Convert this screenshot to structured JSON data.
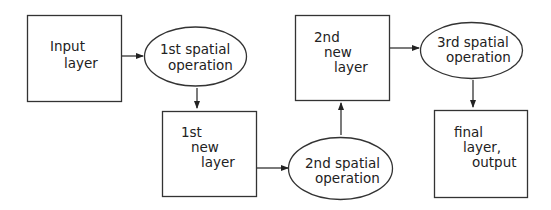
{
  "diagram": {
    "type": "flowchart",
    "nodes": [
      {
        "id": "input_layer",
        "shape": "rect",
        "lines": [
          "Input",
          "layer"
        ]
      },
      {
        "id": "op1",
        "shape": "ellipse",
        "lines": [
          "1st spatial",
          "operation"
        ]
      },
      {
        "id": "new_layer_1",
        "shape": "rect",
        "lines": [
          "1st",
          "new",
          "layer"
        ]
      },
      {
        "id": "op2",
        "shape": "ellipse",
        "lines": [
          "2nd spatial",
          "operation"
        ]
      },
      {
        "id": "new_layer_2",
        "shape": "rect",
        "lines": [
          "2nd",
          "new",
          "layer"
        ]
      },
      {
        "id": "op3",
        "shape": "ellipse",
        "lines": [
          "3rd spatial",
          "operation"
        ]
      },
      {
        "id": "final_layer",
        "shape": "rect",
        "lines": [
          "final",
          "layer,",
          "output"
        ]
      }
    ],
    "edges": [
      {
        "from": "input_layer",
        "to": "op1"
      },
      {
        "from": "op1",
        "to": "new_layer_1"
      },
      {
        "from": "new_layer_1",
        "to": "op2"
      },
      {
        "from": "op2",
        "to": "new_layer_2"
      },
      {
        "from": "new_layer_2",
        "to": "op3"
      },
      {
        "from": "op3",
        "to": "final_layer"
      }
    ]
  }
}
